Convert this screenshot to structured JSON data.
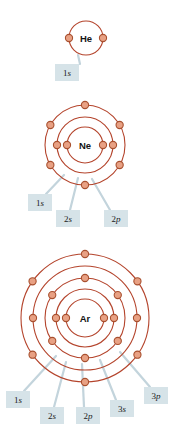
{
  "figure": {
    "kind": "atomic-shell-diagram",
    "background": "#ffffff",
    "colors": {
      "ring_stroke": "#b4442c",
      "electron_fill": "#e8a184",
      "electron_stroke": "#a8502f",
      "label_box_fill": "#d6e3e8",
      "leader_line": "#c3d4dc",
      "text": "#141414"
    }
  },
  "atoms": [
    {
      "id": "helium",
      "symbol": "He",
      "center": {
        "x": 86,
        "y": 38
      },
      "shells": [
        {
          "name": "1s",
          "radius": 17,
          "electrons": 2,
          "angles": [
            180,
            0
          ]
        }
      ],
      "labels": [
        {
          "text": "1s",
          "shell": "1s",
          "box": {
            "x": 55,
            "y": 64,
            "w": 24,
            "h": 17
          },
          "anchor": {
            "x": 78,
            "y": 55
          },
          "leader_from": {
            "x": 80,
            "y": 64
          }
        }
      ]
    },
    {
      "id": "neon",
      "symbol": "Ne",
      "center": {
        "x": 85,
        "y": 145
      },
      "shells": [
        {
          "name": "1s",
          "radius": 18,
          "electrons": 2,
          "angles": [
            180,
            0
          ]
        },
        {
          "name": "2s",
          "radius": 28,
          "electrons": 2,
          "angles": [
            180,
            0
          ]
        },
        {
          "name": "2p",
          "radius": 40,
          "electrons": 6,
          "angles": [
            270,
            330,
            30,
            90,
            150,
            210
          ]
        }
      ],
      "labels": [
        {
          "text": "1s",
          "shell": "1s",
          "box": {
            "x": 28,
            "y": 194,
            "w": 24,
            "h": 17
          },
          "anchor": {
            "x": 64,
            "y": 175
          },
          "leader_from": {
            "x": 46,
            "y": 194
          }
        },
        {
          "text": "2s",
          "shell": "2s",
          "box": {
            "x": 56,
            "y": 210,
            "w": 24,
            "h": 17
          },
          "anchor": {
            "x": 78,
            "y": 178
          },
          "leader_from": {
            "x": 70,
            "y": 210
          }
        },
        {
          "text": "2p",
          "shell": "2p",
          "box": {
            "x": 104,
            "y": 210,
            "w": 24,
            "h": 17
          },
          "anchor": {
            "x": 92,
            "y": 179
          },
          "leader_from": {
            "x": 110,
            "y": 210
          }
        }
      ]
    },
    {
      "id": "argon",
      "symbol": "Ar",
      "center": {
        "x": 85,
        "y": 318
      },
      "shells": [
        {
          "name": "1s",
          "radius": 19,
          "electrons": 2,
          "angles": [
            180,
            0
          ]
        },
        {
          "name": "2s",
          "radius": 29,
          "electrons": 2,
          "angles": [
            180,
            0
          ]
        },
        {
          "name": "2p",
          "radius": 40,
          "electrons": 6,
          "angles": [
            270,
            325,
            35,
            90,
            145,
            215
          ]
        },
        {
          "name": "3s",
          "radius": 52,
          "electrons": 2,
          "angles": [
            180,
            0
          ]
        },
        {
          "name": "3p",
          "radius": 64,
          "electrons": 6,
          "angles": [
            270,
            325,
            35,
            90,
            145,
            215
          ]
        }
      ],
      "labels": [
        {
          "text": "1s",
          "shell": "1s",
          "box": {
            "x": 6,
            "y": 391,
            "w": 24,
            "h": 17
          },
          "anchor": {
            "x": 56,
            "y": 356
          },
          "leader_from": {
            "x": 24,
            "y": 391
          }
        },
        {
          "text": "2s",
          "shell": "2s",
          "box": {
            "x": 40,
            "y": 407,
            "w": 24,
            "h": 17
          },
          "anchor": {
            "x": 66,
            "y": 362
          },
          "leader_from": {
            "x": 54,
            "y": 407
          }
        },
        {
          "text": "2p",
          "shell": "2p",
          "box": {
            "x": 76,
            "y": 407,
            "w": 24,
            "h": 17
          },
          "anchor": {
            "x": 82,
            "y": 364
          },
          "leader_from": {
            "x": 84,
            "y": 407
          }
        },
        {
          "text": "3s",
          "shell": "3s",
          "box": {
            "x": 110,
            "y": 400,
            "w": 24,
            "h": 17
          },
          "anchor": {
            "x": 100,
            "y": 360
          },
          "leader_from": {
            "x": 116,
            "y": 400
          }
        },
        {
          "text": "3p",
          "shell": "3p",
          "box": {
            "x": 144,
            "y": 387,
            "w": 24,
            "h": 17
          },
          "anchor": {
            "x": 120,
            "y": 352
          },
          "leader_from": {
            "x": 150,
            "y": 387
          }
        }
      ]
    }
  ]
}
